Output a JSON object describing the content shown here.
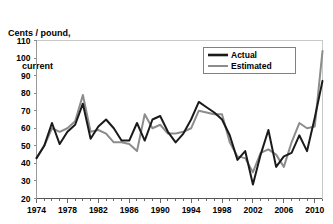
{
  "chart_data": {
    "type": "line",
    "title": "",
    "ylabel": "Cents / pound, current",
    "ylabel_line1": "Cents / pound,",
    "ylabel_line2": "current",
    "xlabel": "",
    "ylim": [
      20,
      110
    ],
    "xlim": [
      1974,
      2011
    ],
    "ytick_labels": [
      "110",
      "100",
      "90",
      "80",
      "70",
      "60",
      "50",
      "40",
      "30",
      "20"
    ],
    "yticks": [
      110,
      100,
      90,
      80,
      70,
      60,
      50,
      40,
      30,
      20
    ],
    "xtick_labels": [
      "1974",
      "1978",
      "1982",
      "1986",
      "1990",
      "1994",
      "1998",
      "2002",
      "2006",
      "2010"
    ],
    "xticks": [
      1974,
      1978,
      1982,
      1986,
      1990,
      1994,
      1998,
      2002,
      2006,
      2010
    ],
    "xtick_minor_step": 1,
    "grid": false,
    "legend_position": "top-right",
    "legend_entries": [
      "Actual",
      "Estimated"
    ],
    "colors": {
      "actual": "#1a1a1a",
      "estimated": "#8c8c8c",
      "axis": "#808080",
      "legend_border": "#808080",
      "background": "#ffffff"
    },
    "x": [
      1974,
      1975,
      1976,
      1977,
      1978,
      1979,
      1980,
      1981,
      1982,
      1983,
      1984,
      1985,
      1986,
      1987,
      1988,
      1989,
      1990,
      1991,
      1992,
      1993,
      1994,
      1995,
      1996,
      1997,
      1998,
      1999,
      2000,
      2001,
      2002,
      2003,
      2004,
      2005,
      2006,
      2007,
      2008,
      2009,
      2010,
      2011
    ],
    "series": [
      {
        "name": "Actual",
        "values": [
          43,
          50,
          63,
          51,
          58,
          62,
          74,
          54,
          61,
          65,
          60,
          53,
          53,
          63,
          53,
          65,
          67,
          58,
          52,
          57,
          65,
          75,
          72,
          69,
          65,
          56,
          42,
          47,
          28,
          45,
          59,
          38,
          44,
          46,
          56,
          47,
          66,
          87
        ]
      },
      {
        "name": "Estimated",
        "values": [
          43,
          50,
          60,
          58,
          60,
          64,
          79,
          58,
          59,
          57,
          52,
          52,
          51,
          47,
          68,
          60,
          62,
          57,
          57,
          58,
          60,
          70,
          69,
          68,
          68,
          52,
          44,
          43,
          35,
          46,
          48,
          45,
          38,
          52,
          63,
          60,
          61,
          104
        ]
      }
    ],
    "annotations": []
  }
}
